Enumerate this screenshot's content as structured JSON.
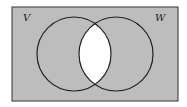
{
  "diagram": {
    "type": "venn",
    "universe": {
      "x": 12,
      "y": 7,
      "width": 166,
      "height": 94,
      "fill": "#bdbdbd",
      "stroke": "#333333"
    },
    "sets": [
      {
        "name": "V",
        "label": "V",
        "cx": 74,
        "cy": 54,
        "r": 37,
        "label_x": 26,
        "label_y": 20
      },
      {
        "name": "W",
        "label": "W",
        "cx": 116,
        "cy": 54,
        "r": 37,
        "label_x": 158,
        "label_y": 20
      }
    ],
    "shaded_region": "complement of V ∩ W",
    "unshaded_region": "V ∩ W",
    "shade_color": "#bdbdbd",
    "unshaded_color": "#ffffff"
  }
}
